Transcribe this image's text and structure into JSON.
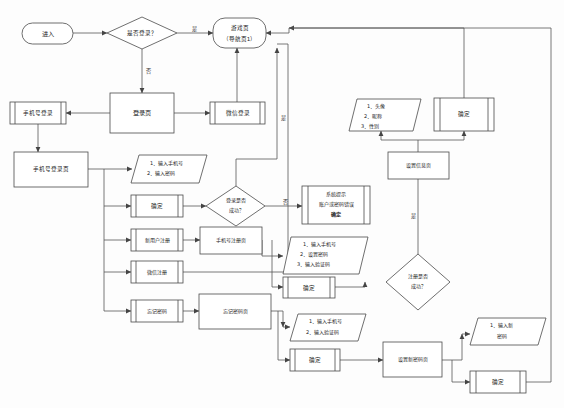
{
  "diagram": {
    "type": "flowchart",
    "labels": {
      "yes": "是",
      "no": "否"
    },
    "nodes": {
      "start": "进入",
      "is_logged_in": "是否登录？",
      "game_page": "游戏页\n（导航页1）",
      "game_page_l1": "游戏页",
      "game_page_l2": "（导航页1）",
      "phone_login_btn": "手机号登录",
      "login_page": "登录页",
      "wechat_login_btn": "微信登录",
      "phone_login_page": "手机号登录页",
      "input_phone_pwd_1": "1．输入手机号",
      "input_phone_pwd_2": "2．输入密码",
      "confirm_login": "确定",
      "login_success": "登录是否\n成功？",
      "login_success_l1": "登录是否",
      "login_success_l2": "成功？",
      "sys_tip_l1": "系统提示",
      "sys_tip_l2": "账户或密码错误",
      "sys_tip_l3": "确定",
      "new_user_reg_btn": "新用户注册",
      "wechat_reg_btn": "微信注册",
      "forgot_pwd_btn": "忘记密码",
      "phone_reg_page": "手机号注册页",
      "reg_steps_1": "1．输入手机号",
      "reg_steps_2": "2．设置密码",
      "reg_steps_3": "3．输入验证码",
      "confirm_reg": "确定",
      "reg_success": "注册是否\n成功？",
      "reg_success_l1": "注册是否",
      "reg_success_l2": "成功？",
      "set_info_page": "设置信息页",
      "info_items_1": "1．头像",
      "info_items_2": "2．昵称",
      "info_items_3": "3．性别",
      "confirm_info": "确定",
      "forgot_pwd_page": "忘记密码页",
      "forgot_steps_1": "1．输入手机号",
      "forgot_steps_2": "2．输入验证码",
      "confirm_forgot": "确定",
      "set_new_pwd_page": "设置新密码页",
      "new_pwd_1": "1．输入新",
      "new_pwd_2": "密码",
      "confirm_new_pwd": "确定"
    },
    "colors": {
      "stroke": "#4a4a4a",
      "edge": "#555555",
      "text": "#222222",
      "background": "#ffffff"
    }
  }
}
